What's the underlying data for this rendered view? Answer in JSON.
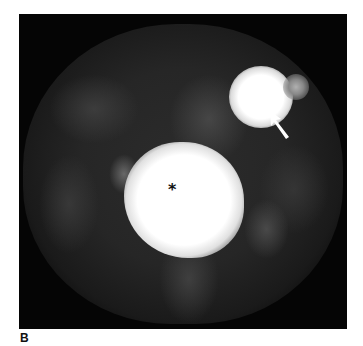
{
  "figure": {
    "panel_label": "B",
    "annotations": {
      "asterisk": "*",
      "arrow": "arrow-pointing-to-lesion"
    },
    "image_description": "Axial grayscale nuclear medicine scan with a large bright central lesion (asterisk) and a smaller bright focus in the upper right (arrow)"
  }
}
